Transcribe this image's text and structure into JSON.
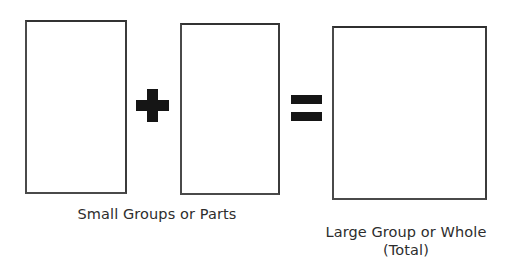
{
  "diagram": {
    "kind": "part-part-whole-math-diagram",
    "background_color": "#ffffff",
    "stroke_color": "#3a3a3a",
    "text_color": "#2d2d2d",
    "shapes": [
      {
        "name": "part-one-rectangle",
        "label": ""
      },
      {
        "name": "part-two-rectangle",
        "label": ""
      },
      {
        "name": "whole-rectangle",
        "label": ""
      }
    ],
    "operators": [
      {
        "name": "plus-operator",
        "glyph": "+"
      },
      {
        "name": "equals-operator",
        "glyph": "="
      }
    ],
    "captions": {
      "parts": "Small Groups or Parts",
      "whole_line1": "Large Group or Whole",
      "whole_line2": "(Total)"
    }
  }
}
